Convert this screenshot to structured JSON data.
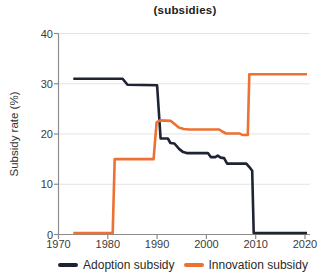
{
  "title": "(subsidies)",
  "chart_data": {
    "type": "line",
    "title": "(subsidies)",
    "xlabel": "",
    "ylabel": "Subsidy rate (%)",
    "xlim": [
      1970,
      2021
    ],
    "ylim": [
      0,
      40
    ],
    "x_ticks": [
      1970,
      1980,
      1990,
      2000,
      2010,
      2020
    ],
    "y_ticks": [
      0,
      10,
      20,
      30,
      40
    ],
    "grid": "horizontal-light",
    "legend_position": "bottom",
    "series": [
      {
        "name": "Adoption subsidy",
        "color": "#1f2433",
        "points": [
          [
            1973,
            31
          ],
          [
            1983,
            31
          ],
          [
            1984,
            29.8
          ],
          [
            1990,
            29.7
          ],
          [
            1990.7,
            19.1
          ],
          [
            1992.2,
            19.1
          ],
          [
            1992.7,
            18.2
          ],
          [
            1993.5,
            18.1
          ],
          [
            1994.5,
            17.0
          ],
          [
            1995.3,
            16.4
          ],
          [
            1996,
            16.2
          ],
          [
            2000.3,
            16.2
          ],
          [
            2000.9,
            15.4
          ],
          [
            2001.8,
            15.4
          ],
          [
            2002.3,
            15.7
          ],
          [
            2002.9,
            15.3
          ],
          [
            2003.6,
            15.2
          ],
          [
            2004.2,
            14.1
          ],
          [
            2008.1,
            14.1
          ],
          [
            2008.9,
            13.2
          ],
          [
            2009.3,
            12.7
          ],
          [
            2009.6,
            0.3
          ],
          [
            2020.4,
            0.3
          ]
        ]
      },
      {
        "name": "Innovation subsidy",
        "color": "#ED7132",
        "points": [
          [
            1973,
            0.3
          ],
          [
            1981,
            0.3
          ],
          [
            1981.4,
            15
          ],
          [
            1989.3,
            15
          ],
          [
            1989.9,
            22.3
          ],
          [
            1990.6,
            22.7
          ],
          [
            1992.8,
            22.6
          ],
          [
            1994.4,
            21.3
          ],
          [
            1995.4,
            21.0
          ],
          [
            1996.5,
            20.9
          ],
          [
            2002.6,
            20.9
          ],
          [
            2003.2,
            20.5
          ],
          [
            2004,
            20.1
          ],
          [
            2006.8,
            20.1
          ],
          [
            2007.3,
            19.8
          ],
          [
            2008.4,
            19.8
          ],
          [
            2008.7,
            31.9
          ],
          [
            2020.4,
            31.9
          ]
        ]
      }
    ]
  }
}
